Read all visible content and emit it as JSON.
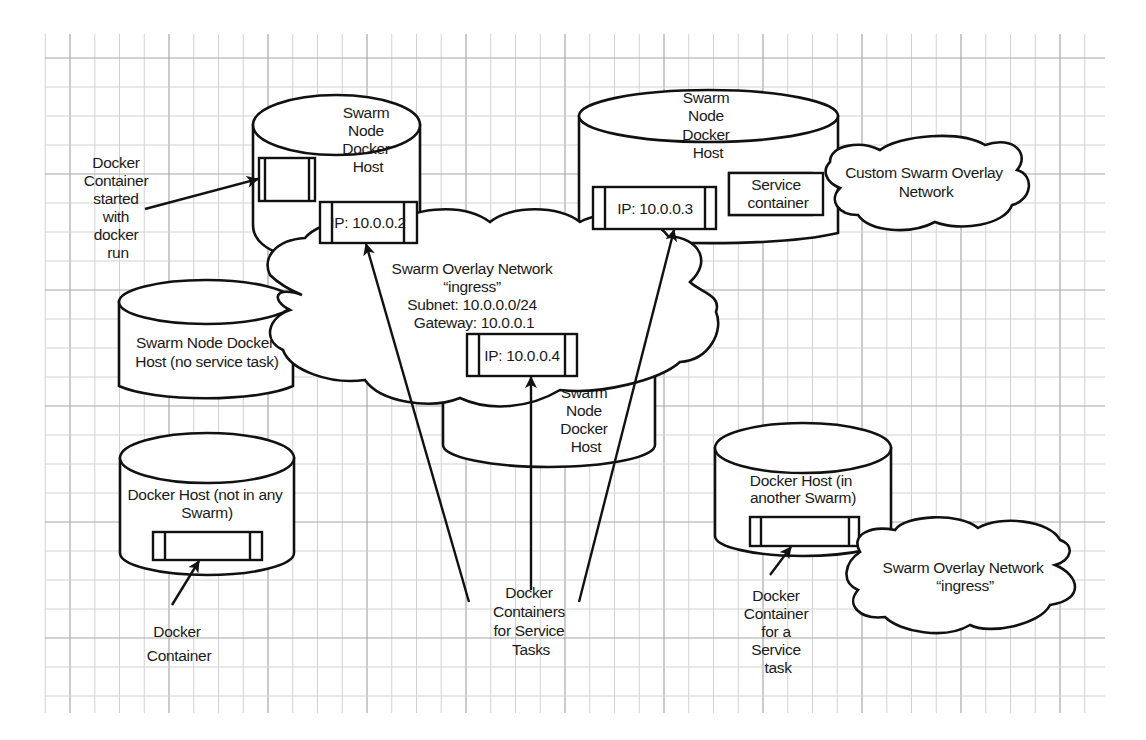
{
  "diagram": {
    "nodes": {
      "host_top_left": {
        "label_lines": [
          "Swarm",
          "Node",
          "Docker",
          "Host"
        ],
        "container_ip": "IP: 10.0.0.2"
      },
      "host_top_right": {
        "label_lines": [
          "Swarm",
          "Node",
          "Docker",
          "Host"
        ],
        "container_ip": "IP: 10.0.0.3",
        "service_container_lines": [
          "Service",
          "container"
        ]
      },
      "host_center": {
        "label_lines": [
          "Swarm",
          "Node",
          "Docker",
          "Host"
        ],
        "container_ip": "IP: 10.0.0.4"
      },
      "host_no_task": {
        "label_lines": [
          "Swarm Node Docker",
          "Host (no service task)"
        ]
      },
      "host_no_swarm": {
        "label_lines": [
          "Docker Host (not in any",
          "Swarm)"
        ]
      },
      "host_other_swarm": {
        "label_lines": [
          "Docker Host (in",
          "another Swarm)"
        ]
      }
    },
    "networks": {
      "ingress_main": {
        "label_lines": [
          "Swarm Overlay Network",
          "“ingress”",
          "Subnet: 10.0.0.0/24",
          "Gateway: 10.0.0.1"
        ]
      },
      "custom_overlay": {
        "label_lines": [
          "Custom Swarm Overlay",
          "Network"
        ]
      },
      "ingress_other": {
        "label_lines": [
          "Swarm Overlay Network",
          "“ingress”"
        ]
      }
    },
    "annotations": {
      "docker_run_container": {
        "label_lines": [
          "Docker",
          "Container",
          "started",
          "with",
          "docker",
          "run"
        ]
      },
      "standalone_container": {
        "label_lines": [
          "Docker",
          "Container"
        ]
      },
      "service_task_containers": {
        "label_lines": [
          "Docker",
          "Containers",
          "for Service",
          "Tasks"
        ]
      },
      "other_swarm_container": {
        "label_lines": [
          "Docker",
          "Container",
          "for a",
          "Service",
          "task"
        ]
      }
    },
    "colors": {
      "line": "#111111",
      "grid_minor": "#d2d2d2",
      "grid_major": "#a8a8a8",
      "background": "#ffffff"
    }
  }
}
